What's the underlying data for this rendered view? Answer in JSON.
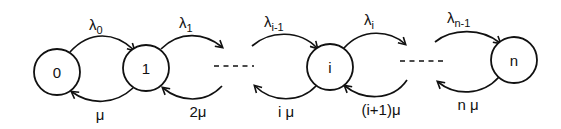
{
  "diagram": {
    "type": "birth-death-process-state-diagram",
    "stroke_color": "#111111",
    "background": "#ffffff",
    "nodes": [
      {
        "id": "0",
        "label": "0"
      },
      {
        "id": "1",
        "label": "1"
      },
      {
        "id": "i",
        "label": "i"
      },
      {
        "id": "n",
        "label": "n"
      }
    ],
    "forward_edges": [
      {
        "from": "0",
        "to": "1",
        "symbol": "λ",
        "subscript": "0"
      },
      {
        "from": "1",
        "to": "…",
        "symbol": "λ",
        "subscript": "1"
      },
      {
        "from": "…",
        "to": "i",
        "symbol": "λ",
        "subscript": "i-1"
      },
      {
        "from": "i",
        "to": "…",
        "symbol": "λ",
        "subscript": "i"
      },
      {
        "from": "…",
        "to": "n",
        "symbol": "λ",
        "subscript": "n-1"
      }
    ],
    "backward_edges": [
      {
        "from": "1",
        "to": "0",
        "label": "μ"
      },
      {
        "from": "…",
        "to": "1",
        "label": "2μ"
      },
      {
        "from": "i",
        "to": "…",
        "label": "i μ"
      },
      {
        "from": "…",
        "to": "i",
        "label": "(i+1)μ"
      },
      {
        "from": "n",
        "to": "…",
        "label": "n μ"
      }
    ],
    "ellipsis_segments": [
      "- - - -",
      "- - - -"
    ]
  }
}
